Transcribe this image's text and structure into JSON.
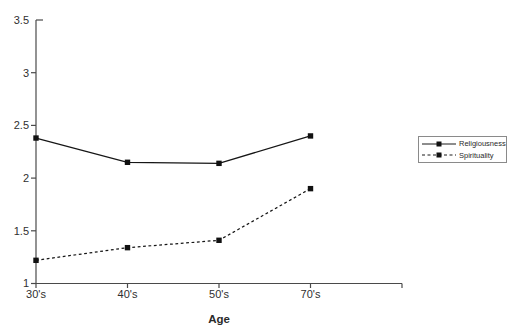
{
  "chart_data": {
    "type": "line",
    "categories": [
      "30's",
      "40's",
      "50's",
      "70's"
    ],
    "series": [
      {
        "name": "Religiousness",
        "style": "solid",
        "marker": "filled-square",
        "values": [
          2.38,
          2.15,
          2.14,
          2.4
        ]
      },
      {
        "name": "Spirituality",
        "style": "dashed",
        "marker": "filled-square",
        "values": [
          1.22,
          1.34,
          1.41,
          1.9
        ]
      }
    ],
    "title": "",
    "xlabel": "Age",
    "ylabel": "",
    "ylim": [
      1,
      3.5
    ],
    "ytick_values": [
      1,
      1.5,
      2,
      2.5,
      3,
      3.5
    ],
    "ytick_labels": [
      "1",
      "1.5",
      "2",
      "2.5",
      "3",
      "3.5"
    ],
    "grid": false,
    "legend_position": "right",
    "colors": {
      "background": "#ffffff",
      "line": "#161616",
      "marker": "#111111",
      "axis": "#4a4a4a",
      "text": "#2f2f2f"
    }
  }
}
